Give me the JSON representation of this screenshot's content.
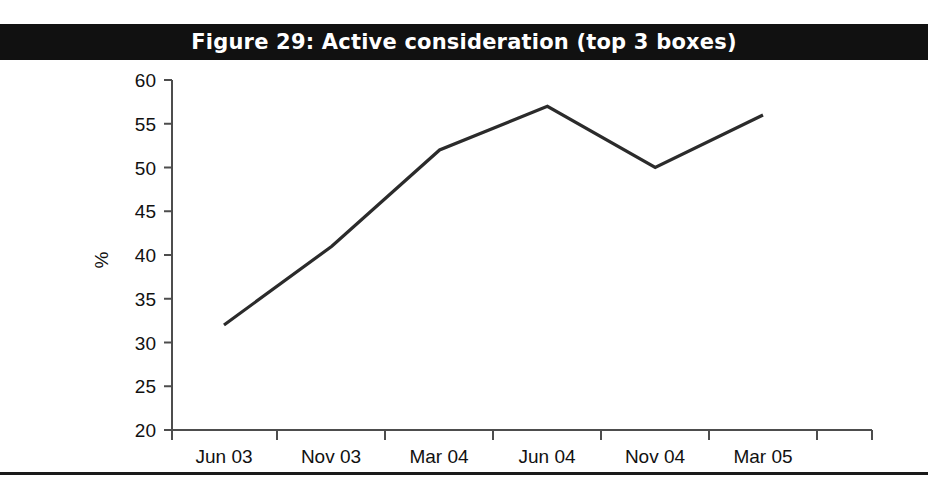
{
  "figure": {
    "title": "Figure 29: Active consideration (top 3 boxes)",
    "banner_color": "#111111",
    "banner_text_color": "#ffffff",
    "line_color": "#2b2b2b",
    "axis_color": "#4d4d4d",
    "background_color": "#ffffff"
  },
  "axis": {
    "y_title": "%",
    "y_ticks": [
      "20",
      "25",
      "30",
      "35",
      "40",
      "45",
      "50",
      "55",
      "60"
    ],
    "x_ticks": [
      "Jun 03",
      "Nov 03",
      "Mar 04",
      "Jun 04",
      "Nov 04",
      "Mar 05"
    ]
  },
  "chart_data": {
    "type": "line",
    "title": "Figure 29: Active consideration (top 3 boxes)",
    "xlabel": "",
    "ylabel": "%",
    "categories": [
      "Jun 03",
      "Nov 03",
      "Mar 04",
      "Jun 04",
      "Nov 04",
      "Mar 05"
    ],
    "values": [
      32,
      41,
      52,
      57,
      50,
      56
    ],
    "series": [
      {
        "name": "Active consideration (top 3 boxes)",
        "values": [
          32,
          41,
          52,
          57,
          50,
          56
        ]
      }
    ],
    "ylim": [
      20,
      60
    ],
    "ytick_step": 5,
    "grid": false,
    "legend": false,
    "legend_position": "none",
    "line_color": "#2b2b2b",
    "markers": false
  }
}
